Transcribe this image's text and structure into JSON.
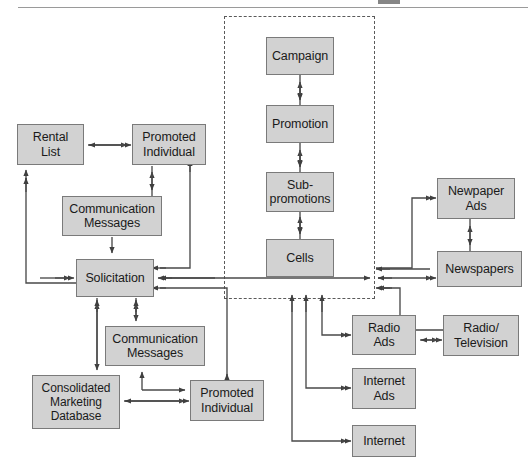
{
  "page": {
    "header_rule": true,
    "header_fragment": ""
  },
  "group": {
    "name": "campaign-hierarchy-group",
    "style": "dashed",
    "x": 224,
    "y": 16,
    "width": 151,
    "height": 283
  },
  "colors": {
    "node_fill": "#d2d2d2",
    "node_border": "#7a7a7a",
    "connector": "#4a4a4a",
    "group_border": "#5a5a5a",
    "text": "#1a1a1a",
    "page_rule": "#9a9a9a"
  },
  "nodes": [
    {
      "id": "rental-list",
      "label": "Rental\nList",
      "x": 17,
      "y": 124,
      "w": 67,
      "h": 41
    },
    {
      "id": "promoted-individual-top",
      "label": "Promoted\nIndividual",
      "x": 132,
      "y": 124,
      "w": 74,
      "h": 41
    },
    {
      "id": "communication-messages-top",
      "label": "Communication\nMessages",
      "x": 62,
      "y": 196,
      "w": 100,
      "h": 40
    },
    {
      "id": "solicitation",
      "label": "Solicitation",
      "x": 76,
      "y": 259,
      "w": 78,
      "h": 38
    },
    {
      "id": "communication-messages-bottom",
      "label": "Communication\nMessages",
      "x": 105,
      "y": 326,
      "w": 100,
      "h": 40
    },
    {
      "id": "consolidated-marketing-database",
      "label": "Consolidated\nMarketing\nDatabase",
      "x": 32,
      "y": 375,
      "w": 88,
      "h": 54
    },
    {
      "id": "promoted-individual-bottom",
      "label": "Promoted\nIndividual",
      "x": 190,
      "y": 380,
      "w": 74,
      "h": 41
    },
    {
      "id": "campaign",
      "label": "Campaign",
      "x": 266,
      "y": 37,
      "w": 68,
      "h": 38
    },
    {
      "id": "promotion",
      "label": "Promotion",
      "x": 266,
      "y": 105,
      "w": 68,
      "h": 38
    },
    {
      "id": "sub-promotions",
      "label": "Sub-\npromotions",
      "x": 266,
      "y": 172,
      "w": 68,
      "h": 40
    },
    {
      "id": "cells",
      "label": "Cells",
      "x": 266,
      "y": 239,
      "w": 68,
      "h": 38
    },
    {
      "id": "newspaper-ads",
      "label": "Newpaper\nAds",
      "x": 437,
      "y": 178,
      "w": 78,
      "h": 41
    },
    {
      "id": "newspapers",
      "label": "Newspapers",
      "x": 437,
      "y": 251,
      "w": 85,
      "h": 36
    },
    {
      "id": "radio-ads",
      "label": "Radio\nAds",
      "x": 352,
      "y": 315,
      "w": 64,
      "h": 40
    },
    {
      "id": "radio-television",
      "label": "Radio/\nTelevision",
      "x": 443,
      "y": 315,
      "w": 76,
      "h": 41
    },
    {
      "id": "internet-ads",
      "label": "Internet\nAds",
      "x": 352,
      "y": 368,
      "w": 64,
      "h": 41
    },
    {
      "id": "internet",
      "label": "Internet",
      "x": 352,
      "y": 425,
      "w": 64,
      "h": 32
    }
  ],
  "connections": [
    {
      "from": "rental-list",
      "to": "promoted-individual-top",
      "direction": "bidirectional"
    },
    {
      "from": "communication-messages-top",
      "to": "promoted-individual-top",
      "direction": "bidirectional"
    },
    {
      "from": "communication-messages-top",
      "to": "solicitation",
      "direction": "forward"
    },
    {
      "from": "solicitation",
      "to": "rental-list",
      "direction": "forward"
    },
    {
      "from": "promoted-individual-top",
      "to": "solicitation",
      "direction": "forward"
    },
    {
      "from": "solicitation",
      "to": "consolidated-marketing-database",
      "direction": "bidirectional"
    },
    {
      "from": "solicitation",
      "to": "communication-messages-bottom",
      "direction": "bidirectional"
    },
    {
      "from": "communication-messages-bottom",
      "to": "promoted-individual-bottom",
      "direction": "forward"
    },
    {
      "from": "consolidated-marketing-database",
      "to": "promoted-individual-bottom",
      "direction": "bidirectional"
    },
    {
      "from": "promoted-individual-bottom",
      "to": "solicitation",
      "direction": "forward"
    },
    {
      "from": "campaign",
      "to": "promotion",
      "direction": "bidirectional"
    },
    {
      "from": "promotion",
      "to": "sub-promotions",
      "direction": "bidirectional"
    },
    {
      "from": "sub-promotions",
      "to": "cells",
      "direction": "bidirectional"
    },
    {
      "from": "solicitation",
      "to": "campaign-hierarchy-group",
      "direction": "bidirectional"
    },
    {
      "from": "campaign-hierarchy-group",
      "to": "newspaper-ads",
      "direction": "forward"
    },
    {
      "from": "campaign-hierarchy-group",
      "to": "newspapers",
      "direction": "bidirectional"
    },
    {
      "from": "newspaper-ads",
      "to": "newspapers",
      "direction": "bidirectional"
    },
    {
      "from": "campaign-hierarchy-group",
      "to": "radio-ads",
      "direction": "forward"
    },
    {
      "from": "radio-ads",
      "to": "radio-television",
      "direction": "bidirectional"
    },
    {
      "from": "radio-television",
      "to": "campaign-hierarchy-group",
      "direction": "forward"
    },
    {
      "from": "campaign-hierarchy-group",
      "to": "internet-ads",
      "direction": "forward"
    },
    {
      "from": "campaign-hierarchy-group",
      "to": "internet",
      "direction": "forward"
    }
  ]
}
